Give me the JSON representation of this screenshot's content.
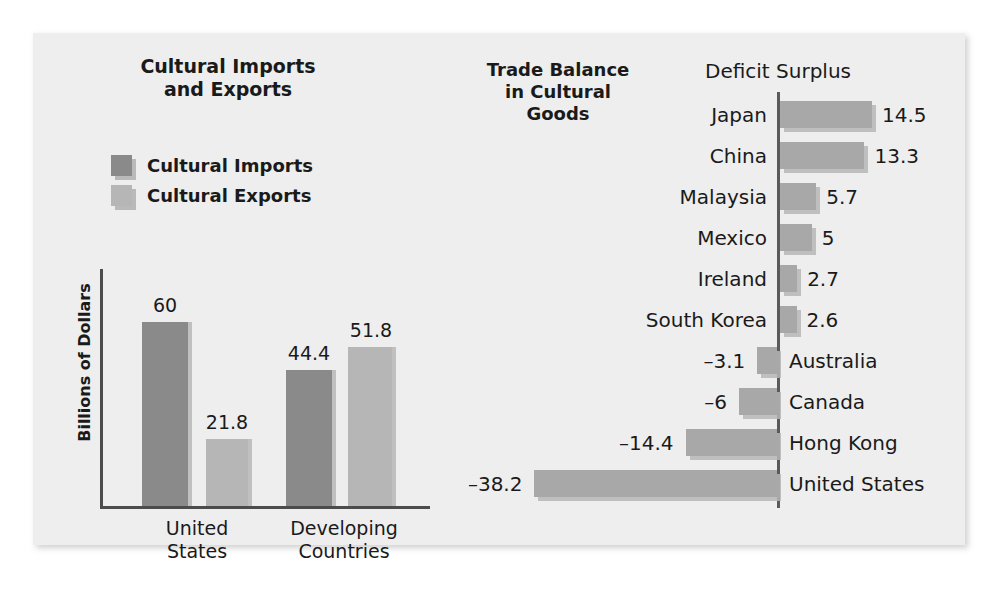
{
  "chart_data": [
    {
      "type": "bar",
      "title": "Cultural Imports and Exports",
      "title_lines": [
        "Cultural Imports",
        "and Exports"
      ],
      "xlabel": "",
      "ylabel": "Billions of Dollars",
      "ylim": [
        0,
        65
      ],
      "grid": false,
      "legend_position": "top-left",
      "orientation": "vertical",
      "categories": [
        "United States",
        "Developing Countries"
      ],
      "category_lines": [
        [
          "United",
          "States"
        ],
        [
          "Developing",
          "Countries"
        ]
      ],
      "series": [
        {
          "name": "Cultural Imports",
          "values": [
            60,
            44.4
          ],
          "value_labels": [
            "60",
            "44.4"
          ],
          "color": "#8a8a8a"
        },
        {
          "name": "Cultural Exports",
          "values": [
            21.8,
            51.8
          ],
          "value_labels": [
            "21.8",
            "51.8"
          ],
          "color": "#b6b6b6"
        }
      ]
    },
    {
      "type": "bar",
      "title": "Trade Balance in Cultural Goods",
      "title_lines": [
        "Trade Balance",
        "in Cultural",
        "Goods"
      ],
      "xlabel": "",
      "ylabel": "",
      "orientation": "horizontal",
      "grid": false,
      "axis_header": "Deficit Surplus",
      "xlim": [
        -40,
        16
      ],
      "bar_color": "#a8a8a8",
      "categories": [
        "Japan",
        "China",
        "Malaysia",
        "Mexico",
        "Ireland",
        "South Korea",
        "Australia",
        "Canada",
        "Hong Kong",
        "United States"
      ],
      "values": [
        14.5,
        13.3,
        5.7,
        5,
        2.7,
        2.6,
        -3.1,
        -6,
        -14.4,
        -38.2
      ],
      "value_labels": [
        "14.5",
        "13.3",
        "5.7",
        "5",
        "2.7",
        "2.6",
        "–3.1",
        "–6",
        "–14.4",
        "–38.2"
      ]
    }
  ],
  "left_chart": {
    "title_line1": "Cultural Imports",
    "title_line2": "and Exports",
    "y_axis_label": "Billions of Dollars",
    "legend": [
      {
        "label": "Cultural Imports",
        "color": "#8a8a8a"
      },
      {
        "label": "Cultural Exports",
        "color": "#b6b6b6"
      }
    ],
    "groups": [
      {
        "name_line1": "United",
        "name_line2": "States",
        "bars": [
          {
            "series": "Cultural Imports",
            "value": 60,
            "label": "60"
          },
          {
            "series": "Cultural Exports",
            "value": 21.8,
            "label": "21.8"
          }
        ]
      },
      {
        "name_line1": "Developing",
        "name_line2": "Countries",
        "bars": [
          {
            "series": "Cultural Imports",
            "value": 44.4,
            "label": "44.4"
          },
          {
            "series": "Cultural Exports",
            "value": 51.8,
            "label": "51.8"
          }
        ]
      }
    ]
  },
  "right_chart": {
    "title_line1": "Trade Balance",
    "title_line2": "in Cultural",
    "title_line3": "Goods",
    "axis_header": "Deficit Surplus",
    "rows": [
      {
        "name": "Japan",
        "value": 14.5,
        "label": "14.5"
      },
      {
        "name": "China",
        "value": 13.3,
        "label": "13.3"
      },
      {
        "name": "Malaysia",
        "value": 5.7,
        "label": "5.7"
      },
      {
        "name": "Mexico",
        "value": 5,
        "label": "5"
      },
      {
        "name": "Ireland",
        "value": 2.7,
        "label": "2.7"
      },
      {
        "name": "South Korea",
        "value": 2.6,
        "label": "2.6"
      },
      {
        "name": "Australia",
        "value": -3.1,
        "label": "–3.1"
      },
      {
        "name": "Canada",
        "value": -6,
        "label": "–6"
      },
      {
        "name": "Hong Kong",
        "value": -14.4,
        "label": "–14.4"
      },
      {
        "name": "United States",
        "value": -38.2,
        "label": "–38.2"
      }
    ]
  },
  "colors": {
    "panel_background": "#eeeeee",
    "page_background": "#ffffff",
    "imports_bar": "#8a8a8a",
    "exports_bar": "#b6b6b6",
    "balance_bar": "#a8a8a8",
    "axis": "#4c4c4c",
    "text": "#1a1a1a"
  }
}
